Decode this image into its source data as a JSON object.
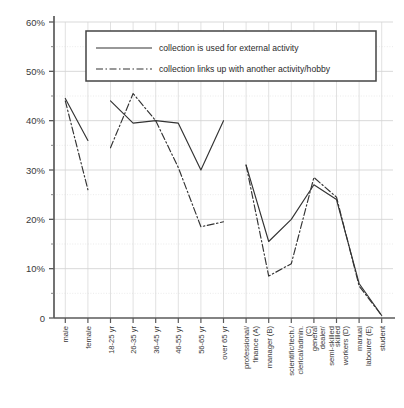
{
  "chart_data": {
    "type": "line",
    "title": "",
    "subtitle": "",
    "xlabel": "",
    "ylabel": "",
    "ylim": [
      0,
      60
    ],
    "ytick_labels": [
      "0",
      "10%",
      "20%",
      "30%",
      "40%",
      "50%",
      "60%"
    ],
    "ytick_values": [
      0,
      10,
      20,
      30,
      40,
      50,
      60
    ],
    "yminor_values": [
      5,
      15,
      25,
      35,
      45,
      55
    ],
    "grid": true,
    "legend_position": "top-center",
    "categories": [
      "male",
      "female",
      "18-25 yr",
      "26-35 yr",
      "36-45 yr",
      "46-55 yr",
      "56-65 yr",
      "over 65 yr",
      "professional/ finance (A)",
      "manager (B)",
      "scientific/tech./ clerical/admin. (C)",
      "general dealer/ semi-skilled",
      "skilled workers (D)",
      "manual labourer (E)",
      "student"
    ],
    "groups": [
      {
        "name": "gender",
        "start": 0,
        "end": 1
      },
      {
        "name": "age",
        "start": 2,
        "end": 7
      },
      {
        "name": "social-grade",
        "start": 8,
        "end": 14
      }
    ],
    "series": [
      {
        "name": "collection is used for external activity",
        "style": "solid",
        "color": "#333333",
        "values": [
          44.5,
          36.0,
          44.0,
          39.5,
          40.0,
          39.5,
          30.0,
          40.0,
          31.0,
          15.5,
          20.0,
          27.0,
          24.0,
          7.0,
          0.5
        ]
      },
      {
        "name": "collection links up with another activity/hobby",
        "style": "dash-dot",
        "color": "#333333",
        "values": [
          44.0,
          26.0,
          34.5,
          45.5,
          40.0,
          30.5,
          18.5,
          19.5,
          31.0,
          8.5,
          11.0,
          28.5,
          24.5,
          6.5,
          0.5
        ]
      }
    ]
  },
  "legend": {
    "entries": [
      {
        "label": "collection is used for external activity",
        "style": "solid"
      },
      {
        "label": "collection links up with another activity/hobby",
        "style": "dash-dot"
      }
    ]
  }
}
